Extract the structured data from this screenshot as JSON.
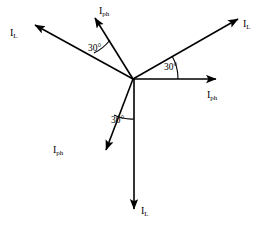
{
  "diagram": {
    "type": "phasor-diagram",
    "canvas": {
      "width": 264,
      "height": 239
    },
    "origin": {
      "x": 133,
      "y": 79
    },
    "stroke_color": "#000000",
    "background_color": "#ffffff",
    "phasors": [
      {
        "id": "iph-right",
        "label": "I",
        "subscript": "ph",
        "quantity": "phase current",
        "angle_deg": 0,
        "tip": {
          "x": 222,
          "y": 79
        },
        "label_pos": {
          "x": 207,
          "y": 90
        }
      },
      {
        "id": "il-upper-right",
        "label": "I",
        "subscript": "L",
        "quantity": "line current",
        "angle_deg": 30,
        "tip": {
          "x": 243,
          "y": 14
        },
        "label_pos": {
          "x": 243,
          "y": 19
        }
      },
      {
        "id": "iph-upper",
        "label": "I",
        "subscript": "ph",
        "quantity": "phase current",
        "angle_deg": 120,
        "tip": {
          "x": 92,
          "y": 12
        },
        "label_pos": {
          "x": 99,
          "y": 6
        }
      },
      {
        "id": "il-upper-left",
        "label": "I",
        "subscript": "L",
        "quantity": "line current",
        "angle_deg": 150,
        "tip": {
          "x": 29,
          "y": 21
        },
        "label_pos": {
          "x": 10,
          "y": 28
        }
      },
      {
        "id": "iph-lower-left",
        "label": "I",
        "subscript": "ph",
        "quantity": "phase current",
        "angle_deg": 240,
        "tip": {
          "x": 101,
          "y": 156
        },
        "label_pos": {
          "x": 53,
          "y": 145
        }
      },
      {
        "id": "il-bottom",
        "label": "I",
        "subscript": "L",
        "quantity": "line current",
        "angle_deg": 270,
        "tip": {
          "x": 134,
          "y": 216
        },
        "label_pos": {
          "x": 141,
          "y": 206
        }
      }
    ],
    "angle_marks": [
      {
        "id": "angle-right",
        "value": "30",
        "unit": "°",
        "between": [
          "iph-right",
          "il-upper-right"
        ],
        "arc_radius": 45,
        "start_deg": 0,
        "end_deg": 30,
        "label_pos": {
          "x": 164,
          "y": 63
        }
      },
      {
        "id": "angle-upper-left",
        "value": "30",
        "unit": "°",
        "between": [
          "il-upper-left",
          "iph-upper"
        ],
        "arc_radius": 45,
        "start_deg": 120,
        "end_deg": 150,
        "label_pos": {
          "x": 88,
          "y": 44
        }
      },
      {
        "id": "angle-bottom",
        "value": "30",
        "unit": "°",
        "between": [
          "iph-lower-left",
          "il-bottom"
        ],
        "arc_radius": 40,
        "start_deg": 240,
        "end_deg": 270,
        "label_pos": {
          "x": 111,
          "y": 116
        }
      }
    ]
  }
}
